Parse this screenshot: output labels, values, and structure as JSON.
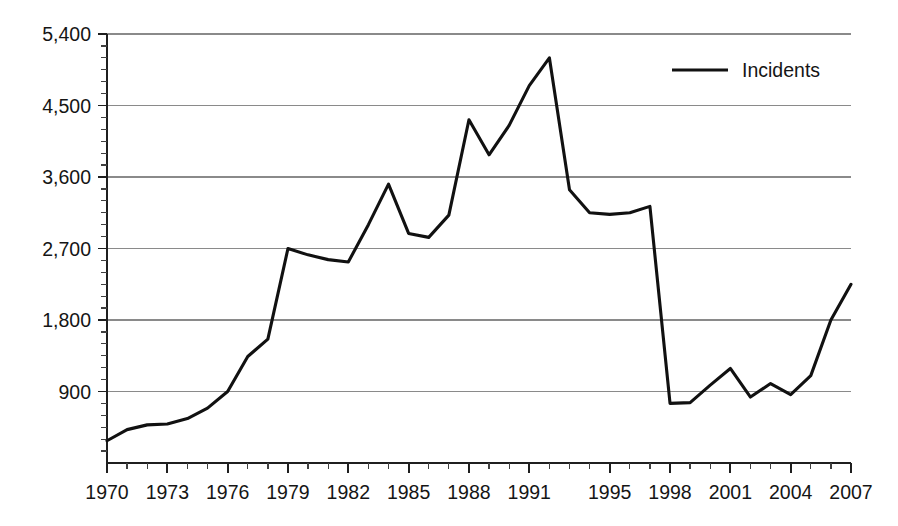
{
  "chart_data": {
    "type": "line",
    "title": "",
    "subtitle": "",
    "xlabel": "",
    "ylabel": "",
    "grid": "horizontal",
    "legend_position": "top-right",
    "xlim": [
      1970,
      2007
    ],
    "ylim": [
      0,
      5400
    ],
    "y_ticks": [
      900,
      1800,
      2700,
      3600,
      4500,
      5400
    ],
    "y_tick_labels": [
      "900",
      "1,800",
      "2,700",
      "3,600",
      "4,500",
      "5,400"
    ],
    "y_minor_interval": 150,
    "x_ticks": [
      1970,
      1973,
      1976,
      1979,
      1982,
      1985,
      1988,
      1991,
      1995,
      1998,
      2001,
      2004,
      2007
    ],
    "x_tick_labels": [
      "1970",
      "1973",
      "1976",
      "1979",
      "1982",
      "1985",
      "1988",
      "1991",
      "1995",
      "1998",
      "2001",
      "2004",
      "2007"
    ],
    "x_minor_interval": 1,
    "x": [
      1970,
      1971,
      1972,
      1973,
      1974,
      1975,
      1976,
      1977,
      1978,
      1979,
      1980,
      1981,
      1982,
      1983,
      1984,
      1985,
      1986,
      1987,
      1988,
      1989,
      1990,
      1991,
      1992,
      1993,
      1994,
      1995,
      1996,
      1997,
      1998,
      1999,
      2000,
      2001,
      2002,
      2003,
      2004,
      2005,
      2006,
      2007
    ],
    "series": [
      {
        "name": "Incidents",
        "color": "#111111",
        "values": [
          280,
          420,
          480,
          490,
          560,
          690,
          900,
          1340,
          1560,
          2700,
          2620,
          2560,
          2530,
          3000,
          3510,
          2890,
          2840,
          3120,
          4320,
          3880,
          4250,
          4750,
          5100,
          3440,
          3150,
          3130,
          3150,
          3230,
          750,
          760,
          980,
          1190,
          830,
          1000,
          860,
          1100,
          1800,
          2250
        ]
      }
    ],
    "annotations": []
  },
  "legend": {
    "entries": [
      {
        "label": "Incidents",
        "color": "#111111"
      }
    ]
  }
}
